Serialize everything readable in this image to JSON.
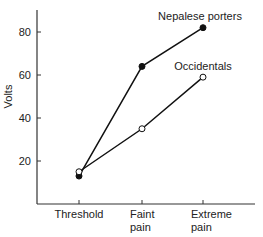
{
  "chart_data": {
    "type": "line",
    "title": "",
    "xlabel": "",
    "ylabel": "Volts",
    "categories": [
      "Threshold",
      "Faint pain",
      "Extreme pain"
    ],
    "category_lines": [
      [
        "Threshold"
      ],
      [
        "Faint",
        "pain"
      ],
      [
        "Extreme",
        "pain"
      ]
    ],
    "yticks": [
      20,
      40,
      60,
      80
    ],
    "ylim": [
      0,
      90
    ],
    "grid": false,
    "series": [
      {
        "name": "Nepalese porters",
        "marker": "filled-circle",
        "values": [
          13,
          64,
          82
        ]
      },
      {
        "name": "Occidentals",
        "marker": "open-circle",
        "values": [
          15,
          35,
          59
        ]
      }
    ],
    "legend_position": "inline-labels"
  }
}
